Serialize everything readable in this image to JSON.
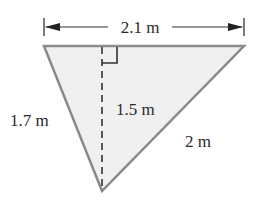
{
  "figure": {
    "type": "triangle",
    "fill_color": "#f0f0f0",
    "stroke_color": "#8a8a8a",
    "labels": {
      "top_width": "2.1 m",
      "left_side": "1.7 m",
      "height": "1.5 m",
      "right_side": "2 m"
    }
  }
}
